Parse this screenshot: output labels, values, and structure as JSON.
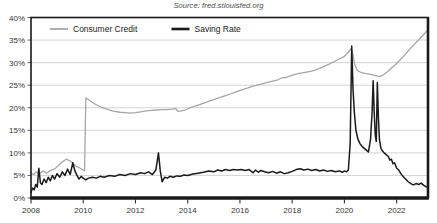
{
  "source_note": "Source: fred.stlouisfed.org",
  "title_partial": "",
  "chart_data": {
    "type": "line",
    "title": "",
    "subtitle": "Source: fred.stlouisfed.org",
    "xlabel": "",
    "ylabel": "",
    "xlim": [
      2008.0,
      2023.2
    ],
    "ylim": [
      0,
      40
    ],
    "ytick_step": 5,
    "ytick_labels": [
      "0%",
      "5%",
      "10%",
      "15%",
      "20%",
      "25%",
      "30%",
      "35%",
      "40%"
    ],
    "ytick_values": [
      0,
      5,
      10,
      15,
      20,
      25,
      30,
      35,
      40
    ],
    "xtick_labels": [
      "2008",
      "2010",
      "2012",
      "2014",
      "2016",
      "2018",
      "2020",
      "2022"
    ],
    "xtick_values": [
      2008,
      2010,
      2012,
      2014,
      2016,
      2018,
      2020,
      2022
    ],
    "grid": "horizontal",
    "legend_position": "top-left-inside",
    "colors": {
      "consumer_credit": "#a6a6a6",
      "saving_rate": "#1a1a1a",
      "grid": "#cfcfcf",
      "axis": "#1a1a1a",
      "text": "#333333"
    },
    "series": [
      {
        "name": "Consumer Credit",
        "color": "#a6a6a6",
        "points": [
          [
            2008.0,
            5.6
          ],
          [
            2008.1,
            5.2
          ],
          [
            2008.2,
            5.8
          ],
          [
            2008.3,
            5.3
          ],
          [
            2008.45,
            6.0
          ],
          [
            2008.6,
            5.5
          ],
          [
            2008.75,
            6.1
          ],
          [
            2008.9,
            6.4
          ],
          [
            2009.05,
            7.2
          ],
          [
            2009.2,
            8.0
          ],
          [
            2009.35,
            8.6
          ],
          [
            2009.5,
            8.2
          ],
          [
            2009.62,
            7.6
          ],
          [
            2009.75,
            7.0
          ],
          [
            2009.88,
            6.6
          ],
          [
            2010.0,
            6.2
          ],
          [
            2010.05,
            6.0
          ],
          [
            2010.1,
            22.2
          ],
          [
            2010.25,
            21.6
          ],
          [
            2010.4,
            21.0
          ],
          [
            2010.55,
            20.5
          ],
          [
            2010.7,
            20.1
          ],
          [
            2010.85,
            19.8
          ],
          [
            2011.0,
            19.5
          ],
          [
            2011.2,
            19.2
          ],
          [
            2011.4,
            19.0
          ],
          [
            2011.6,
            18.9
          ],
          [
            2011.8,
            18.8
          ],
          [
            2012.0,
            18.9
          ],
          [
            2012.2,
            19.1
          ],
          [
            2012.4,
            19.3
          ],
          [
            2012.6,
            19.4
          ],
          [
            2012.8,
            19.5
          ],
          [
            2013.0,
            19.6
          ],
          [
            2013.2,
            19.6
          ],
          [
            2013.4,
            19.7
          ],
          [
            2013.55,
            19.8
          ],
          [
            2013.62,
            19.2
          ],
          [
            2013.75,
            19.3
          ],
          [
            2013.9,
            19.5
          ],
          [
            2014.05,
            19.9
          ],
          [
            2014.25,
            20.3
          ],
          [
            2014.45,
            20.7
          ],
          [
            2014.65,
            21.1
          ],
          [
            2014.85,
            21.5
          ],
          [
            2015.05,
            21.9
          ],
          [
            2015.25,
            22.3
          ],
          [
            2015.45,
            22.7
          ],
          [
            2015.65,
            23.1
          ],
          [
            2015.85,
            23.5
          ],
          [
            2016.05,
            23.9
          ],
          [
            2016.25,
            24.3
          ],
          [
            2016.45,
            24.7
          ],
          [
            2016.65,
            25.0
          ],
          [
            2016.85,
            25.3
          ],
          [
            2017.05,
            25.6
          ],
          [
            2017.25,
            25.9
          ],
          [
            2017.45,
            26.2
          ],
          [
            2017.6,
            26.6
          ],
          [
            2017.75,
            26.7
          ],
          [
            2017.9,
            27.0
          ],
          [
            2018.05,
            27.3
          ],
          [
            2018.25,
            27.6
          ],
          [
            2018.45,
            27.8
          ],
          [
            2018.65,
            28.0
          ],
          [
            2018.85,
            28.3
          ],
          [
            2019.0,
            28.6
          ],
          [
            2019.2,
            29.1
          ],
          [
            2019.4,
            29.6
          ],
          [
            2019.6,
            30.2
          ],
          [
            2019.8,
            30.8
          ],
          [
            2020.0,
            31.4
          ],
          [
            2020.15,
            32.3
          ],
          [
            2020.25,
            33.1
          ],
          [
            2020.32,
            32.0
          ],
          [
            2020.4,
            29.4
          ],
          [
            2020.5,
            28.2
          ],
          [
            2020.65,
            27.8
          ],
          [
            2020.8,
            27.6
          ],
          [
            2021.0,
            27.4
          ],
          [
            2021.2,
            27.1
          ],
          [
            2021.35,
            26.9
          ],
          [
            2021.5,
            27.3
          ],
          [
            2021.65,
            28.0
          ],
          [
            2021.8,
            28.8
          ],
          [
            2022.0,
            29.8
          ],
          [
            2022.2,
            31.0
          ],
          [
            2022.4,
            32.3
          ],
          [
            2022.6,
            33.6
          ],
          [
            2022.8,
            34.8
          ],
          [
            2023.0,
            36.0
          ],
          [
            2023.15,
            37.0
          ]
        ]
      },
      {
        "name": "Saving Rate",
        "color": "#1a1a1a",
        "points": [
          [
            2008.0,
            1.2
          ],
          [
            2008.06,
            2.2
          ],
          [
            2008.12,
            1.8
          ],
          [
            2008.18,
            3.0
          ],
          [
            2008.24,
            2.4
          ],
          [
            2008.3,
            6.6
          ],
          [
            2008.36,
            3.4
          ],
          [
            2008.42,
            3.0
          ],
          [
            2008.5,
            4.2
          ],
          [
            2008.58,
            3.4
          ],
          [
            2008.66,
            4.6
          ],
          [
            2008.74,
            3.8
          ],
          [
            2008.82,
            5.0
          ],
          [
            2008.9,
            4.2
          ],
          [
            2009.0,
            5.4
          ],
          [
            2009.1,
            4.6
          ],
          [
            2009.2,
            5.8
          ],
          [
            2009.3,
            5.0
          ],
          [
            2009.4,
            6.4
          ],
          [
            2009.5,
            5.2
          ],
          [
            2009.6,
            7.8
          ],
          [
            2009.68,
            6.0
          ],
          [
            2009.76,
            5.0
          ],
          [
            2009.84,
            4.2
          ],
          [
            2009.92,
            4.8
          ],
          [
            2010.0,
            4.4
          ],
          [
            2010.1,
            4.0
          ],
          [
            2010.2,
            4.4
          ],
          [
            2010.35,
            4.6
          ],
          [
            2010.5,
            4.4
          ],
          [
            2010.65,
            4.8
          ],
          [
            2010.8,
            4.6
          ],
          [
            2011.0,
            5.0
          ],
          [
            2011.2,
            4.8
          ],
          [
            2011.4,
            5.2
          ],
          [
            2011.6,
            5.0
          ],
          [
            2011.8,
            5.4
          ],
          [
            2012.0,
            5.2
          ],
          [
            2012.2,
            5.6
          ],
          [
            2012.35,
            5.4
          ],
          [
            2012.5,
            5.8
          ],
          [
            2012.65,
            5.2
          ],
          [
            2012.78,
            6.2
          ],
          [
            2012.88,
            10.0
          ],
          [
            2012.95,
            6.0
          ],
          [
            2013.02,
            3.6
          ],
          [
            2013.12,
            4.6
          ],
          [
            2013.22,
            4.4
          ],
          [
            2013.32,
            4.8
          ],
          [
            2013.45,
            4.6
          ],
          [
            2013.58,
            4.9
          ],
          [
            2013.72,
            4.8
          ],
          [
            2013.86,
            5.1
          ],
          [
            2014.0,
            5.0
          ],
          [
            2014.2,
            5.3
          ],
          [
            2014.4,
            5.5
          ],
          [
            2014.6,
            5.7
          ],
          [
            2014.8,
            6.0
          ],
          [
            2015.0,
            5.8
          ],
          [
            2015.15,
            6.2
          ],
          [
            2015.3,
            6.0
          ],
          [
            2015.45,
            6.3
          ],
          [
            2015.6,
            6.1
          ],
          [
            2015.75,
            6.3
          ],
          [
            2015.9,
            6.2
          ],
          [
            2016.05,
            6.3
          ],
          [
            2016.2,
            6.1
          ],
          [
            2016.35,
            6.3
          ],
          [
            2016.5,
            5.6
          ],
          [
            2016.6,
            6.2
          ],
          [
            2016.7,
            5.7
          ],
          [
            2016.8,
            6.1
          ],
          [
            2016.95,
            5.8
          ],
          [
            2017.1,
            5.6
          ],
          [
            2017.25,
            5.9
          ],
          [
            2017.4,
            5.5
          ],
          [
            2017.55,
            5.8
          ],
          [
            2017.7,
            5.4
          ],
          [
            2017.85,
            5.6
          ],
          [
            2018.0,
            5.9
          ],
          [
            2018.15,
            6.3
          ],
          [
            2018.3,
            6.5
          ],
          [
            2018.45,
            6.2
          ],
          [
            2018.6,
            6.4
          ],
          [
            2018.75,
            6.1
          ],
          [
            2018.9,
            6.3
          ],
          [
            2019.05,
            6.0
          ],
          [
            2019.2,
            6.2
          ],
          [
            2019.35,
            5.9
          ],
          [
            2019.5,
            6.1
          ],
          [
            2019.65,
            5.8
          ],
          [
            2019.8,
            6.0
          ],
          [
            2019.92,
            5.7
          ],
          [
            2020.0,
            6.0
          ],
          [
            2020.08,
            5.8
          ],
          [
            2020.15,
            6.2
          ],
          [
            2020.22,
            12.0
          ],
          [
            2020.28,
            33.7
          ],
          [
            2020.33,
            24.0
          ],
          [
            2020.38,
            19.0
          ],
          [
            2020.44,
            15.0
          ],
          [
            2020.52,
            13.0
          ],
          [
            2020.6,
            12.0
          ],
          [
            2020.68,
            11.4
          ],
          [
            2020.76,
            11.0
          ],
          [
            2020.84,
            10.6
          ],
          [
            2020.92,
            10.2
          ],
          [
            2021.0,
            13.0
          ],
          [
            2021.06,
            19.0
          ],
          [
            2021.1,
            26.0
          ],
          [
            2021.14,
            19.0
          ],
          [
            2021.18,
            14.0
          ],
          [
            2021.22,
            12.5
          ],
          [
            2021.26,
            25.6
          ],
          [
            2021.3,
            18.0
          ],
          [
            2021.34,
            13.0
          ],
          [
            2021.4,
            11.0
          ],
          [
            2021.46,
            10.4
          ],
          [
            2021.52,
            10.0
          ],
          [
            2021.6,
            9.6
          ],
          [
            2021.68,
            9.2
          ],
          [
            2021.74,
            8.4
          ],
          [
            2021.8,
            8.6
          ],
          [
            2021.86,
            7.6
          ],
          [
            2021.92,
            7.8
          ],
          [
            2022.0,
            6.6
          ],
          [
            2022.08,
            6.2
          ],
          [
            2022.16,
            5.4
          ],
          [
            2022.24,
            4.8
          ],
          [
            2022.34,
            4.2
          ],
          [
            2022.44,
            3.6
          ],
          [
            2022.54,
            3.2
          ],
          [
            2022.64,
            2.9
          ],
          [
            2022.74,
            3.2
          ],
          [
            2022.84,
            3.0
          ],
          [
            2022.94,
            3.3
          ],
          [
            2023.04,
            2.8
          ],
          [
            2023.15,
            2.4
          ]
        ]
      }
    ]
  }
}
